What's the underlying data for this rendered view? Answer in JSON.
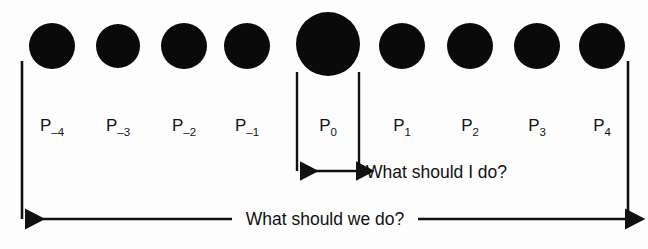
{
  "figure": {
    "background_color": "#fdfdfd",
    "ink_color": "#111111",
    "dot_color": "#0a0a0a",
    "persons": [
      {
        "id": "p-minus-4",
        "base": "P",
        "subscript": "–4",
        "cx": 52,
        "cy": 46,
        "r": 23
      },
      {
        "id": "p-minus-3",
        "base": "P",
        "subscript": "–3",
        "cx": 118,
        "cy": 46,
        "r": 22
      },
      {
        "id": "p-minus-2",
        "base": "P",
        "subscript": "–2",
        "cx": 184,
        "cy": 46,
        "r": 23
      },
      {
        "id": "p-minus-1",
        "base": "P",
        "subscript": "–1",
        "cx": 247,
        "cy": 46,
        "r": 23
      },
      {
        "id": "p-zero",
        "base": "P",
        "subscript": "0",
        "cx": 328,
        "cy": 44,
        "r": 32
      },
      {
        "id": "p-plus-1",
        "base": "P",
        "subscript": "1",
        "cx": 402,
        "cy": 46,
        "r": 23
      },
      {
        "id": "p-plus-2",
        "base": "P",
        "subscript": "2",
        "cx": 470,
        "cy": 46,
        "r": 23
      },
      {
        "id": "p-plus-3",
        "base": "P",
        "subscript": "3",
        "cx": 537,
        "cy": 46,
        "r": 23
      },
      {
        "id": "p-plus-4",
        "base": "P",
        "subscript": "4",
        "cx": 602,
        "cy": 46,
        "r": 23
      }
    ],
    "label_baseline_y": 131,
    "brackets": {
      "outer_left_x": 22,
      "outer_right_x": 628,
      "outer_top_y": 61,
      "inner_left_x": 297,
      "inner_right_x": 359,
      "inner_top_y": 72
    },
    "arrows": {
      "local": {
        "label": "What should I do?",
        "y": 171,
        "x_start": 297,
        "x_end": 359,
        "label_x": 366,
        "label_baseline_y": 178
      },
      "global": {
        "label": "What should we do?",
        "y": 219,
        "x_start": 22,
        "x_end": 628,
        "label_x": 325,
        "label_baseline_y": 225,
        "gap_half_width": 93
      }
    }
  }
}
